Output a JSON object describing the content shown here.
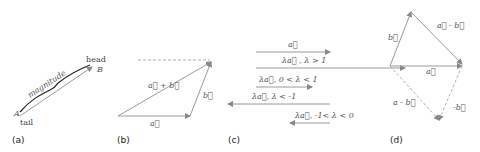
{
  "panels": {
    "a": {
      "caption": "(a)",
      "labels": {
        "head": "head",
        "tail": "tail",
        "start_point": "A",
        "end_point": "B",
        "magnitude": "magnitude"
      }
    },
    "b": {
      "caption": "(b)",
      "labels": {
        "sum": "a⃗ + b⃗",
        "b": "b⃗",
        "a": "a⃗"
      }
    },
    "c": {
      "caption": "(c)",
      "rows": [
        {
          "label": "a⃗"
        },
        {
          "label": "λa⃗ , λ > 1"
        },
        {
          "label": "λa⃗, 0 < λ < 1"
        },
        {
          "label": "λa⃗, λ < -1"
        },
        {
          "label": "λa⃗, -1< λ < 0"
        }
      ]
    },
    "d": {
      "caption": "(d)",
      "labels": {
        "b": "b⃗",
        "diff": "a⃗ - b⃗",
        "a": "a⃗",
        "diff_dashed": "a - b⃗",
        "neg_b": "-b⃗"
      }
    }
  },
  "colors": {
    "stroke": "#9a9a9a",
    "text": "#444444",
    "caption": "#222222"
  }
}
